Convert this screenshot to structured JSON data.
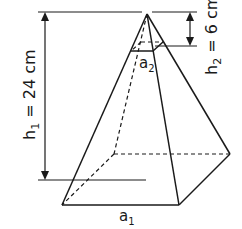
{
  "diagram": {
    "type": "truncated pyramid (square pyramid with small top pyramid cut off)",
    "labels": {
      "h1": "h",
      "h1_sub": "1",
      "h1_rest": " = 24 cm",
      "h2": "h",
      "h2_sub": "2",
      "h2_rest": " = 6 cm",
      "a1": "a",
      "a1_sub": "1",
      "a2": "a",
      "a2_sub": "2"
    },
    "values": {
      "h1_cm": 24,
      "h2_cm": 6
    },
    "colors": {
      "stroke": "#1a1a1a",
      "background": "#ffffff"
    }
  }
}
